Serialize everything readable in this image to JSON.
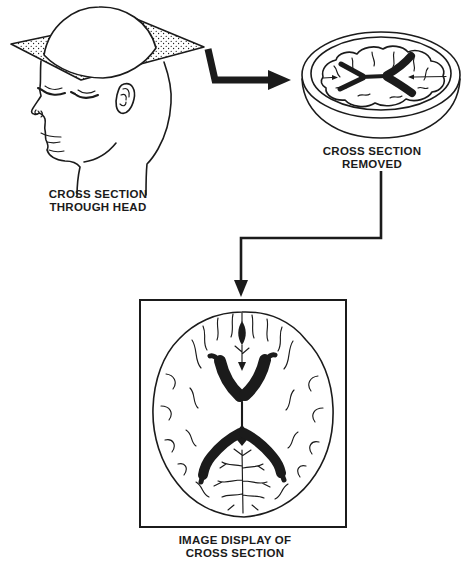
{
  "colors": {
    "background": "#ffffff",
    "ink": "#1b1b1b"
  },
  "captions": {
    "head": {
      "line1": "CROSS SECTION",
      "line2": "THROUGH HEAD"
    },
    "slice": {
      "line1": "CROSS SECTION",
      "line2": "REMOVED"
    },
    "display": {
      "line1": "IMAGE DISPLAY OF",
      "line2": "CROSS SECTION"
    }
  }
}
